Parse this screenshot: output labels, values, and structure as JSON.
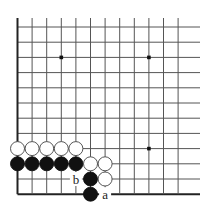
{
  "diagram": {
    "board": {
      "origin_x": 17.5,
      "origin_y": 27,
      "col_spacing": 14.6,
      "row_spacing": 15.2,
      "cols": 13,
      "rows": 12,
      "top_extension_y": 18,
      "right_extension_x": 200,
      "line_color": "#555555",
      "edge_color": "#222222",
      "background": "#ffffff",
      "open_top": true,
      "open_right": true,
      "edges": [
        "left",
        "bottom"
      ]
    },
    "star_points": [
      {
        "col": 3,
        "row": 2
      },
      {
        "col": 9,
        "row": 2
      },
      {
        "col": 9,
        "row": 8
      }
    ],
    "stones": [
      {
        "color": "white",
        "col": 0,
        "row": 8
      },
      {
        "color": "white",
        "col": 1,
        "row": 8
      },
      {
        "color": "white",
        "col": 2,
        "row": 8
      },
      {
        "color": "white",
        "col": 3,
        "row": 8
      },
      {
        "color": "white",
        "col": 4,
        "row": 8
      },
      {
        "color": "black",
        "col": 0,
        "row": 9
      },
      {
        "color": "black",
        "col": 1,
        "row": 9
      },
      {
        "color": "black",
        "col": 2,
        "row": 9
      },
      {
        "color": "black",
        "col": 3,
        "row": 9
      },
      {
        "color": "black",
        "col": 4,
        "row": 9
      },
      {
        "color": "white",
        "col": 5,
        "row": 9
      },
      {
        "color": "white",
        "col": 6,
        "row": 9
      },
      {
        "color": "black",
        "col": 5,
        "row": 10
      },
      {
        "color": "white",
        "col": 6,
        "row": 10
      },
      {
        "color": "black",
        "col": 5,
        "row": 11
      }
    ],
    "labels": [
      {
        "text": "b",
        "col": 4,
        "row": 10
      },
      {
        "text": "a",
        "col": 6,
        "row": 11
      }
    ],
    "colors": {
      "black_stone": "#111111",
      "white_stone": "#ffffff",
      "white_stone_border": "#444444"
    }
  }
}
